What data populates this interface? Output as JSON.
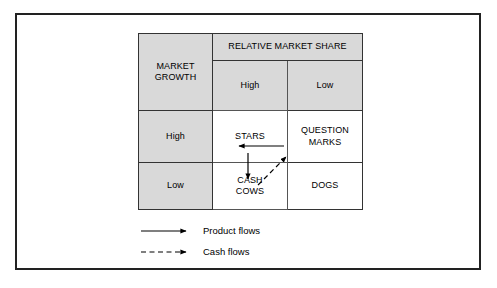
{
  "figure": {
    "kind": "bcg-growth-share-matrix"
  },
  "matrix": {
    "row_axis_label": "MARKET\nGROWTH",
    "row_axis_label_line1": "MARKET",
    "row_axis_label_line2": "GROWTH",
    "column_axis_label": "RELATIVE MARKET SHARE",
    "column_headers": [
      "High",
      "Low"
    ],
    "row_headers": [
      "High",
      "Low"
    ],
    "cells": [
      [
        {
          "label": "STARS",
          "line1": "STARS",
          "line2": ""
        },
        {
          "label": "QUESTION MARKS",
          "line1": "QUESTION",
          "line2": "MARKS"
        }
      ],
      [
        {
          "label": "CASH COWS",
          "line1": "CASH",
          "line2": "COWS"
        },
        {
          "label": "DOGS",
          "line1": "DOGS",
          "line2": ""
        }
      ]
    ]
  },
  "arrows": [
    {
      "name": "question-marks-to-stars",
      "style": "solid",
      "meaning": "Product flows",
      "from": "QUESTION MARKS",
      "to": "STARS",
      "direction": "left"
    },
    {
      "name": "stars-to-cash-cows",
      "style": "solid",
      "meaning": "Product flows",
      "from": "STARS",
      "to": "CASH COWS",
      "direction": "down"
    },
    {
      "name": "cash-cows-to-question-marks",
      "style": "dashed",
      "meaning": "Cash flows",
      "from": "CASH COWS",
      "to": "QUESTION MARKS",
      "direction": "up-right"
    }
  ],
  "legend": {
    "items": [
      {
        "label": "Product flows",
        "style": "solid"
      },
      {
        "label": "Cash flows",
        "style": "dashed"
      }
    ]
  },
  "colors": {
    "header_fill": "#d9d9d9",
    "cell_fill": "#ffffff",
    "line": "#333333",
    "frame": "#222222",
    "text": "#000000"
  }
}
